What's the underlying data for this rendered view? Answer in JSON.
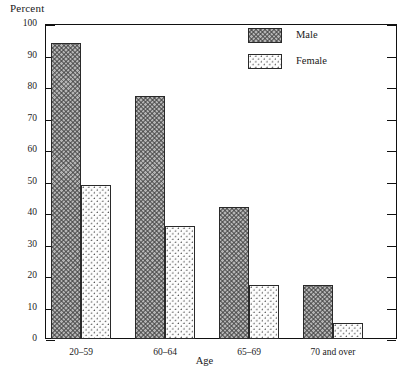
{
  "chart_data": {
    "type": "bar",
    "title": "",
    "ylabel": "Percent",
    "xlabel": "Age",
    "categories": [
      "20–59",
      "60–64",
      "65–69",
      "70 and over"
    ],
    "series": [
      {
        "name": "Male",
        "values": [
          94,
          77,
          42,
          17
        ]
      },
      {
        "name": "Female",
        "values": [
          49,
          36,
          17,
          5
        ]
      }
    ],
    "ylim": [
      0,
      100
    ],
    "yticks": [
      0,
      10,
      20,
      30,
      40,
      50,
      60,
      70,
      80,
      90,
      100
    ],
    "ytick_labels": [
      "0",
      "10",
      "20",
      "30",
      "40",
      "50",
      "60",
      "70",
      "80",
      "90",
      "100"
    ],
    "grid": false,
    "legend_position": "upper-center",
    "legend_entries": [
      "Male",
      "Female"
    ],
    "colors": {
      "male_fill": "#b4b4b4",
      "female_fill": "#fdfdfd",
      "outline": "#2a2a2a",
      "axis": "#111111"
    }
  }
}
